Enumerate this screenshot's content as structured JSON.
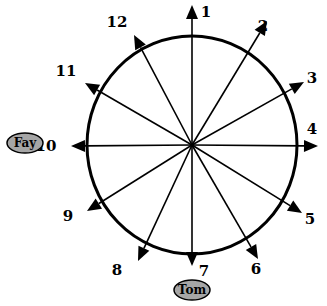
{
  "diagram": {
    "type": "radial-spoke-diagram",
    "center": {
      "x": 192,
      "y": 145
    },
    "circle": {
      "rx": 105,
      "ry": 109,
      "stroke": "#000000",
      "stroke_width": 3
    },
    "spokes": [
      {
        "label": "1",
        "tip": [
          192,
          5
        ],
        "label_pos": [
          206,
          17
        ]
      },
      {
        "label": "2",
        "tip": [
          267,
          21
        ],
        "label_pos": [
          263,
          31
        ]
      },
      {
        "label": "3",
        "tip": [
          304,
          82
        ],
        "label_pos": [
          312,
          83
        ]
      },
      {
        "label": "4",
        "tip": [
          318,
          146
        ],
        "label_pos": [
          312,
          134
        ]
      },
      {
        "label": "5",
        "tip": [
          302,
          213
        ],
        "label_pos": [
          310,
          224
        ]
      },
      {
        "label": "6",
        "tip": [
          258,
          259
        ],
        "label_pos": [
          256,
          274
        ]
      },
      {
        "label": "7",
        "tip": [
          192,
          266
        ],
        "label_pos": [
          204,
          276
        ]
      },
      {
        "label": "8",
        "tip": [
          138,
          261
        ],
        "label_pos": [
          117,
          275
        ]
      },
      {
        "label": "9",
        "tip": [
          87,
          211
        ],
        "label_pos": [
          68,
          221
        ]
      },
      {
        "label": "10",
        "tip": [
          71,
          146
        ],
        "label_pos": [
          46,
          151
        ]
      },
      {
        "label": "11",
        "tip": [
          85,
          83
        ],
        "label_pos": [
          66,
          76
        ]
      },
      {
        "label": "12",
        "tip": [
          134,
          35
        ],
        "label_pos": [
          117,
          27
        ]
      }
    ],
    "people": [
      {
        "name": "Fay",
        "at_spoke": "10",
        "ellipse": {
          "cx": 25,
          "cy": 143,
          "rx": 18,
          "ry": 10
        },
        "fill": "#a6a6a6"
      },
      {
        "name": "Tom",
        "at_spoke": "7",
        "ellipse": {
          "cx": 192,
          "cy": 290,
          "rx": 18,
          "ry": 10
        },
        "fill": "#a6a6a6"
      }
    ]
  }
}
